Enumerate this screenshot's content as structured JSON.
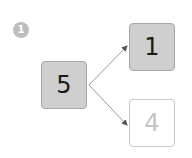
{
  "step_badge": "1",
  "diagram": {
    "root": {
      "value": "5",
      "style": "filled"
    },
    "children": [
      {
        "value": "1",
        "style": "filled"
      },
      {
        "value": "4",
        "style": "empty"
      }
    ]
  },
  "colors": {
    "filled_box": "#cfcfcf",
    "empty_box_text": "#c4c4c4",
    "badge": "#bdbdbd",
    "arrow": "#888888"
  }
}
